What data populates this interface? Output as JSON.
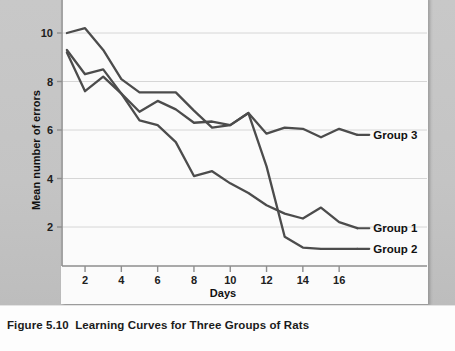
{
  "figure": {
    "number": "Figure 5.10",
    "title": "Learning Curves for Three Groups of Rats"
  },
  "chart_data": {
    "type": "line",
    "title": "",
    "xlabel": "Days",
    "ylabel": "Mean number of errors",
    "xlim": [
      0.2,
      17.6
    ],
    "ylim": [
      0.3,
      10.9
    ],
    "xticks": [
      2,
      4,
      6,
      8,
      10,
      12,
      14,
      16
    ],
    "yticks": [
      2,
      4,
      6,
      8,
      10
    ],
    "grid": "horizontal",
    "legend_position": "right-inline-labels",
    "line_color": "#4c4c4c",
    "x": [
      1,
      2,
      3,
      4,
      5,
      6,
      7,
      8,
      9,
      10,
      11,
      12,
      13,
      14,
      15,
      16,
      17
    ],
    "series": [
      {
        "name": "Group 1",
        "label": "Group 1",
        "values": [
          9.2,
          7.6,
          8.2,
          7.5,
          6.4,
          6.2,
          5.5,
          4.1,
          4.3,
          3.8,
          3.4,
          2.9,
          2.55,
          2.35,
          2.8,
          2.2,
          1.95
        ]
      },
      {
        "name": "Group 2",
        "label": "Group 2",
        "values": [
          10.0,
          10.2,
          9.3,
          8.1,
          7.55,
          7.55,
          7.55,
          6.8,
          6.1,
          6.2,
          6.7,
          4.5,
          1.6,
          1.15,
          1.1,
          1.1,
          1.1
        ]
      },
      {
        "name": "Group 3",
        "label": "Group 3",
        "values": [
          9.3,
          8.3,
          8.5,
          7.5,
          6.75,
          7.2,
          6.85,
          6.3,
          6.35,
          6.2,
          6.7,
          5.85,
          6.1,
          6.05,
          5.7,
          6.05,
          5.8
        ]
      }
    ]
  }
}
